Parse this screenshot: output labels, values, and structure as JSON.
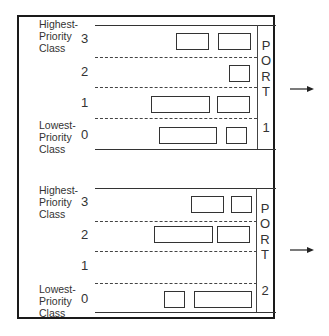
{
  "diagram": {
    "queues": [
      {
        "port_letters": [
          "P",
          "O",
          "R",
          "T"
        ],
        "port_number": "1",
        "highest_label": [
          "Highest-",
          "Priority",
          "Class"
        ],
        "lowest_label": [
          "Lowest-",
          "Priority",
          "Class"
        ],
        "classes": [
          {
            "id": "3",
            "packets": 2
          },
          {
            "id": "2",
            "packets": 1
          },
          {
            "id": "1",
            "packets": 2
          },
          {
            "id": "0",
            "packets": 2
          }
        ]
      },
      {
        "port_letters": [
          "P",
          "O",
          "R",
          "T"
        ],
        "port_number": "2",
        "highest_label": [
          "Highest-",
          "Priority",
          "Class"
        ],
        "lowest_label": [
          "Lowest-",
          "Priority",
          "Class"
        ],
        "classes": [
          {
            "id": "3",
            "packets": 2
          },
          {
            "id": "2",
            "packets": 2
          },
          {
            "id": "1",
            "packets": 0
          },
          {
            "id": "0",
            "packets": 2
          }
        ]
      }
    ],
    "arrow_icon": "right-arrow-icon"
  }
}
